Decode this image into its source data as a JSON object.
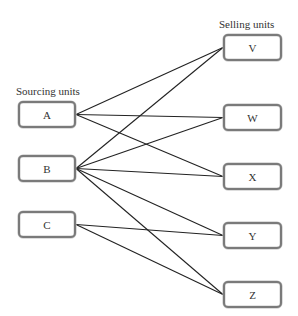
{
  "labels": {
    "sourcing": "Sourcing units",
    "selling": "Selling units"
  },
  "sourcing_units": [
    {
      "id": "A",
      "label": "A",
      "x": 18,
      "y": 101,
      "w": 58,
      "h": 27
    },
    {
      "id": "B",
      "label": "B",
      "x": 18,
      "y": 155,
      "w": 58,
      "h": 27
    },
    {
      "id": "C",
      "label": "C",
      "x": 18,
      "y": 211,
      "w": 58,
      "h": 27
    }
  ],
  "selling_units": [
    {
      "id": "V",
      "label": "V",
      "x": 223,
      "y": 34,
      "w": 59,
      "h": 27
    },
    {
      "id": "W",
      "label": "W",
      "x": 223,
      "y": 104,
      "w": 59,
      "h": 27
    },
    {
      "id": "X",
      "label": "X",
      "x": 223,
      "y": 163,
      "w": 59,
      "h": 27
    },
    {
      "id": "Y",
      "label": "Y",
      "x": 223,
      "y": 222,
      "w": 59,
      "h": 27
    },
    {
      "id": "Z",
      "label": "Z",
      "x": 223,
      "y": 281,
      "w": 59,
      "h": 27
    }
  ],
  "connections": [
    {
      "from": "A",
      "to": "V"
    },
    {
      "from": "A",
      "to": "W"
    },
    {
      "from": "A",
      "to": "X"
    },
    {
      "from": "B",
      "to": "V"
    },
    {
      "from": "B",
      "to": "W"
    },
    {
      "from": "B",
      "to": "X"
    },
    {
      "from": "B",
      "to": "Y"
    },
    {
      "from": "B",
      "to": "Z"
    },
    {
      "from": "C",
      "to": "Y"
    },
    {
      "from": "C",
      "to": "Z"
    }
  ],
  "colors": {
    "line": "#222222",
    "box_border": "#7a7a7a",
    "text": "#333333"
  }
}
